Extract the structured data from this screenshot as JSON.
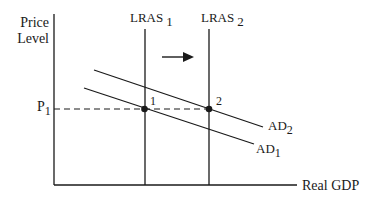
{
  "diagram": {
    "type": "economics-ad-lras",
    "y_axis_label_line1": "Price",
    "y_axis_label_line2": "Level",
    "x_axis_label": "Real GDP",
    "price_level_label": "P",
    "price_level_sub": "1",
    "lras1_label": "LRAS",
    "lras1_sub": "1",
    "lras2_label": "LRAS",
    "lras2_sub": "2",
    "ad1_label": "AD",
    "ad1_sub": "1",
    "ad2_label": "AD",
    "ad2_sub": "2",
    "point1_label": "1",
    "point2_label": "2",
    "shift_arrow": "right-arrow-icon",
    "colors": {
      "line": "#1a1a1a",
      "background": "#ffffff"
    }
  }
}
